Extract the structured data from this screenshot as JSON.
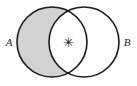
{
  "figure": {
    "kind": "venn-diagram",
    "width": 137,
    "height": 86,
    "background_color": "#ffffff"
  },
  "style": {
    "stroke_color": "#1a1a1a",
    "stroke_width": 1.6,
    "shaded_fill": "#d2d2d2",
    "unshaded_fill": "#ffffff",
    "label_color": "#1a1a1a"
  },
  "sets": [
    {
      "id": "A",
      "label": "A",
      "side": "left",
      "center_x": 52,
      "center_y": 42,
      "radius": 35,
      "label_x": 9,
      "label_y": 46,
      "region_shaded": true
    },
    {
      "id": "B",
      "label": "B",
      "side": "right",
      "center_x": 84,
      "center_y": 42,
      "radius": 35,
      "label_x": 127,
      "label_y": 46,
      "region_shaded": false
    }
  ],
  "regions": {
    "a_only": {
      "name": "A-only",
      "fill": "#d2d2d2",
      "shaded": true
    },
    "intersection": {
      "name": "A-intersect-B",
      "fill": "#ffffff",
      "shaded": false
    },
    "b_only": {
      "name": "B-only",
      "fill": "#ffffff",
      "shaded": false
    }
  },
  "annotations": [
    {
      "id": "asterisk",
      "glyph": "✳",
      "icon_name": "asterisk-icon",
      "x": 68,
      "y": 47,
      "region": "intersection"
    }
  ]
}
